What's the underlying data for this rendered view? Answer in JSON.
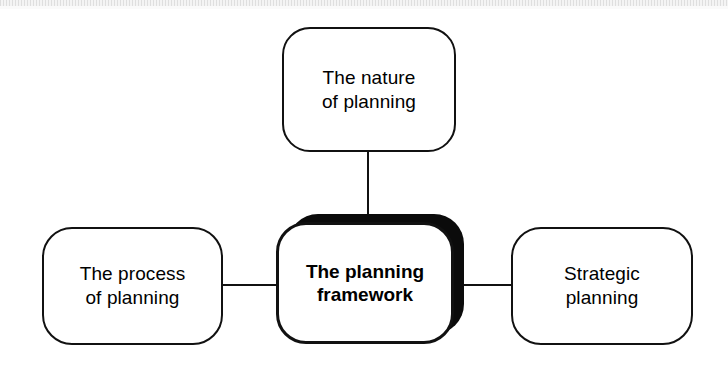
{
  "diagram": {
    "type": "hub-and-spoke",
    "title": "The planning framework",
    "center": {
      "id": "framework",
      "label": "The planning\nframework",
      "emphasis": "bold",
      "shadow": true
    },
    "nodes": [
      {
        "id": "nature",
        "label": "The nature\nof planning",
        "position": "top"
      },
      {
        "id": "process",
        "label": "The process\nof planning",
        "position": "left"
      },
      {
        "id": "strategic",
        "label": "Strategic\nplanning",
        "position": "right"
      }
    ],
    "connectors": [
      {
        "id": "top",
        "from": "framework",
        "to": "nature",
        "orientation": "vertical"
      },
      {
        "id": "left",
        "from": "process",
        "to": "framework",
        "orientation": "horizontal"
      },
      {
        "id": "right",
        "from": "framework",
        "to": "strategic",
        "orientation": "horizontal"
      }
    ],
    "colors": {
      "stroke": "#111111",
      "fill": "#ffffff",
      "shadow": "#0b0b0b",
      "text": "#000000",
      "background": "#ffffff"
    }
  }
}
